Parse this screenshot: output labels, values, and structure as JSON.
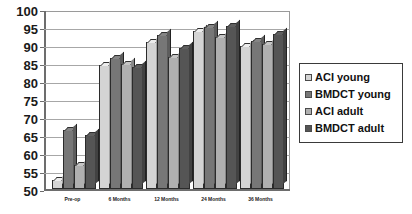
{
  "chart_data": {
    "type": "bar",
    "title": "",
    "subtitle": "",
    "xlabel": "",
    "ylabel": "",
    "ylim": [
      50,
      100
    ],
    "ytick_step": 5,
    "yticks": [
      100,
      95,
      90,
      85,
      80,
      75,
      70,
      65,
      60,
      55,
      50
    ],
    "grid": true,
    "legend_position": "right",
    "categories": [
      "Pre-op",
      "6 Months",
      "12 Months",
      "24 Months",
      "36 Months"
    ],
    "series": [
      {
        "name": "ACI young",
        "color": "#d4d4d4",
        "values": [
          52.5,
          84.5,
          90.8,
          93.8,
          89.7
        ]
      },
      {
        "name": "BMDCT young",
        "color": "#777777",
        "values": [
          66.5,
          86.5,
          92.7,
          95.0,
          91.0
        ]
      },
      {
        "name": "ACI adult",
        "color": "#b0b0b0",
        "values": [
          56.8,
          84.8,
          86.7,
          92.2,
          90.2
        ]
      },
      {
        "name": "BMDCT adult",
        "color": "#555555",
        "values": [
          65.0,
          84.0,
          89.2,
          95.2,
          93.0
        ]
      }
    ]
  },
  "legend": {
    "items": [
      {
        "label": "ACI young"
      },
      {
        "label": "BMDCT young"
      },
      {
        "label": "ACI adult"
      },
      {
        "label": "BMDCT adult"
      }
    ]
  },
  "axes": {
    "y_labels": [
      "100",
      "95",
      "90",
      "85",
      "80",
      "75",
      "70",
      "65",
      "60",
      "55",
      "50"
    ],
    "x_labels": [
      "Pre-op",
      "6 Months",
      "12 Months",
      "24 Months",
      "36 Months"
    ]
  }
}
